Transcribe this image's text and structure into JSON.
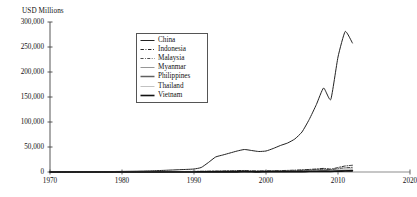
{
  "chart_data": {
    "type": "line",
    "title": "",
    "ylabel": "USD Millions",
    "xlabel": "",
    "ylim": [
      0,
      300000
    ],
    "xlim": [
      1970,
      2020
    ],
    "grid": false,
    "legend_position": "upper-left-inside",
    "y_ticks": [
      "0",
      "50,000",
      "100,000",
      "150,000",
      "200,000",
      "250,000",
      "300,000"
    ],
    "y_tick_values": [
      0,
      50000,
      100000,
      150000,
      200000,
      250000,
      300000
    ],
    "x_ticks": [
      "1970",
      "1980",
      "1990",
      "2000",
      "2010",
      "2020"
    ],
    "x_tick_values": [
      1970,
      1980,
      1990,
      2000,
      2010,
      2020
    ],
    "x": [
      1970,
      1971,
      1972,
      1973,
      1974,
      1975,
      1976,
      1977,
      1978,
      1979,
      1980,
      1981,
      1982,
      1983,
      1984,
      1985,
      1986,
      1987,
      1988,
      1989,
      1990,
      1991,
      1992,
      1993,
      1994,
      1995,
      1996,
      1997,
      1998,
      1999,
      2000,
      2001,
      2002,
      2003,
      2004,
      2005,
      2006,
      2007,
      2008,
      2009,
      2010,
      2011,
      2012
    ],
    "series": [
      {
        "name": "China",
        "style": "solid",
        "color": "#222222",
        "width": 1.0,
        "values": [
          300,
          350,
          400,
          450,
          500,
          600,
          700,
          800,
          900,
          1000,
          1200,
          1400,
          1600,
          1900,
          2300,
          2800,
          3400,
          4000,
          4600,
          5200,
          6000,
          9000,
          19000,
          30000,
          34000,
          38000,
          42000,
          45000,
          43000,
          41000,
          42000,
          47000,
          53000,
          58000,
          66000,
          80000,
          105000,
          135000,
          168000,
          145000,
          230000,
          281000,
          258000
        ]
      },
      {
        "name": "Indonesia",
        "style": "dash-dot",
        "color": "#222222",
        "width": 1.0,
        "values": [
          80,
          90,
          100,
          120,
          140,
          170,
          200,
          240,
          280,
          330,
          400,
          450,
          500,
          560,
          620,
          700,
          780,
          860,
          950,
          1100,
          1300,
          1500,
          1700,
          1900,
          2100,
          2400,
          2700,
          3000,
          2200,
          2000,
          2300,
          2500,
          2800,
          3200,
          3700,
          4300,
          5100,
          6000,
          7200,
          5800,
          9000,
          12000,
          13500
        ]
      },
      {
        "name": "Malaysia",
        "style": "dash-dot",
        "color": "#3a3a3a",
        "width": 0.9,
        "values": [
          60,
          70,
          80,
          95,
          110,
          130,
          150,
          180,
          210,
          250,
          300,
          340,
          380,
          430,
          480,
          540,
          600,
          670,
          750,
          860,
          1000,
          1150,
          1300,
          1450,
          1600,
          1800,
          2000,
          2200,
          1700,
          1600,
          1800,
          1900,
          2100,
          2400,
          2800,
          3300,
          3900,
          4600,
          5500,
          4500,
          6800,
          8500,
          9300
        ]
      },
      {
        "name": "Myanmar",
        "style": "solid",
        "color": "#8a8a8a",
        "width": 0.7,
        "values": [
          20,
          22,
          25,
          28,
          32,
          36,
          40,
          45,
          50,
          56,
          63,
          70,
          78,
          86,
          95,
          105,
          115,
          126,
          138,
          150,
          165,
          180,
          196,
          212,
          230,
          250,
          270,
          290,
          260,
          250,
          270,
          290,
          310,
          340,
          380,
          430,
          500,
          580,
          680,
          600,
          820,
          1000,
          1100
        ]
      },
      {
        "name": "Philippines",
        "style": "solid",
        "color": "#606060",
        "width": 1.5,
        "values": [
          40,
          45,
          50,
          58,
          66,
          75,
          85,
          96,
          108,
          122,
          138,
          155,
          173,
          193,
          215,
          238,
          263,
          290,
          320,
          355,
          395,
          438,
          485,
          535,
          590,
          650,
          715,
          785,
          700,
          680,
          740,
          800,
          870,
          960,
          1070,
          1200,
          1400,
          1650,
          1950,
          1700,
          2400,
          3000,
          3300
        ]
      },
      {
        "name": "Thailand",
        "style": "solid",
        "color": "#c2c2c2",
        "width": 1.0,
        "values": [
          70,
          80,
          92,
          106,
          122,
          140,
          160,
          183,
          208,
          236,
          268,
          303,
          342,
          385,
          433,
          486,
          545,
          610,
          682,
          762,
          850,
          948,
          1055,
          1172,
          1300,
          1440,
          1590,
          1755,
          1400,
          1350,
          1500,
          1620,
          1760,
          1950,
          2200,
          2500,
          2900,
          3400,
          4050,
          3500,
          5000,
          6300,
          6900
        ]
      },
      {
        "name": "Vietnam",
        "style": "solid",
        "color": "#111111",
        "width": 1.6,
        "values": [
          10,
          11,
          12,
          14,
          16,
          18,
          21,
          24,
          27,
          31,
          36,
          41,
          47,
          54,
          62,
          71,
          82,
          94,
          108,
          124,
          143,
          164,
          189,
          217,
          250,
          287,
          330,
          379,
          350,
          340,
          380,
          430,
          490,
          560,
          650,
          760,
          900,
          1080,
          1300,
          1150,
          1600,
          2050,
          2300
        ]
      }
    ]
  },
  "legend": {
    "items": [
      {
        "label": "China"
      },
      {
        "label": "Indonesia"
      },
      {
        "label": "Malaysia"
      },
      {
        "label": "Myanmar"
      },
      {
        "label": "Philippines"
      },
      {
        "label": "Thailand"
      },
      {
        "label": "Vietnam"
      }
    ]
  },
  "caption": {
    "text": ""
  }
}
